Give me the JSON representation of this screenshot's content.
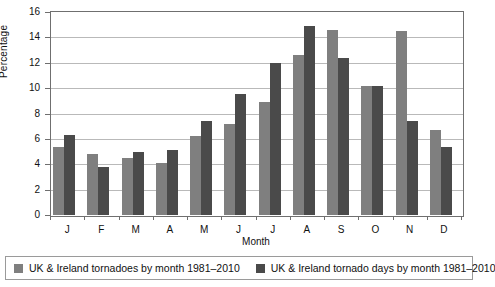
{
  "chart_data": {
    "type": "bar",
    "title": "",
    "xlabel": "Month",
    "ylabel": "Percentage",
    "ylim": [
      0,
      16
    ],
    "ytick_step": 2,
    "yticks": [
      0,
      2,
      4,
      6,
      8,
      10,
      12,
      14,
      16
    ],
    "grid": true,
    "legend_position": "bottom",
    "categories": [
      "J",
      "F",
      "M",
      "A",
      "M",
      "J",
      "J",
      "A",
      "S",
      "O",
      "N",
      "D"
    ],
    "series": [
      {
        "name": "UK & Ireland tornadoes by month 1981–2010",
        "color": "#7f7f7f",
        "values": [
          5.4,
          4.8,
          4.5,
          4.1,
          6.2,
          7.2,
          8.9,
          12.6,
          14.6,
          10.2,
          14.5,
          6.7
        ]
      },
      {
        "name": "UK & Ireland tornado days by month 1981–2010",
        "color": "#4a4a4a",
        "values": [
          6.3,
          3.8,
          5.0,
          5.1,
          7.4,
          9.5,
          12.0,
          14.9,
          12.4,
          10.2,
          7.4,
          5.4
        ]
      }
    ]
  },
  "axes": {
    "y_title": "Percentage",
    "x_title": "Month"
  },
  "legend": {
    "items": [
      {
        "label": "UK & Ireland tornadoes by month 1981–2010",
        "color": "#7f7f7f"
      },
      {
        "label": "UK & Ireland tornado days by month 1981–2010",
        "color": "#4a4a4a"
      }
    ]
  },
  "colors": {
    "series_light": "#7f7f7f",
    "series_dark": "#4a4a4a",
    "gridline": "#b9b9b9",
    "axis": "#6f6f6f",
    "background": "#ffffff"
  }
}
